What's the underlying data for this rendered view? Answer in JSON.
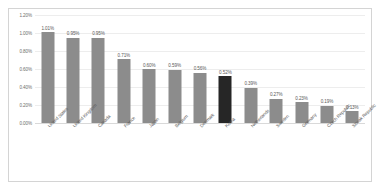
{
  "chart_data": {
    "type": "bar",
    "title": "",
    "xlabel": "",
    "ylabel": "",
    "ylim": [
      0.0,
      1.2
    ],
    "ytick_labels": [
      "1.20%",
      "1.00%",
      "0.80%",
      "0.60%",
      "0.40%",
      "0.20%",
      "0.00%"
    ],
    "ytick_values": [
      1.2,
      1.0,
      0.8,
      0.6,
      0.4,
      0.2,
      0.0
    ],
    "grid": true,
    "legend": "none",
    "categories": [
      "United States",
      "United Kingdom",
      "Canada",
      "France",
      "Japan",
      "Belgium",
      "Denmark",
      "Korea",
      "Netherlands",
      "Sweden",
      "Germany",
      "Czech Republic",
      "Slovak Republic"
    ],
    "values": [
      1.01,
      0.95,
      0.95,
      0.71,
      0.6,
      0.59,
      0.56,
      0.52,
      0.39,
      0.27,
      0.23,
      0.19,
      0.13
    ],
    "data_labels": [
      "1.01%",
      "0.95%",
      "0.95%",
      "0.71%",
      "0.60%",
      "0.59%",
      "0.56%",
      "0.52%",
      "0.39%",
      "0.27%",
      "0.23%",
      "0.19%",
      "0.13%"
    ],
    "highlight_index": 7,
    "colors": {
      "bar": "#8c8c8c",
      "bar_highlight": "#262626",
      "gridline": "#ededed",
      "axis": "#d9d9d9",
      "label_text": "#5a5a5a",
      "tick_text": "#6d6d6d",
      "frame_border": "#d4d4d4",
      "background": "#ffffff"
    }
  }
}
